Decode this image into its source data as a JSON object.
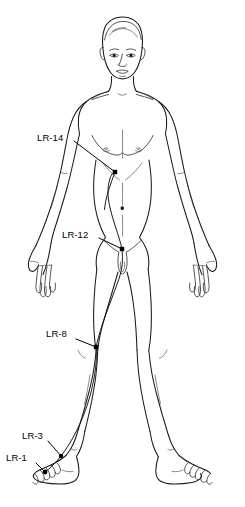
{
  "figure": {
    "view": "anterior full-body line drawing",
    "background_color": "#ffffff",
    "line_color": "#1a1a1a",
    "label_color": "#000000"
  },
  "acupoints": [
    {
      "id": "LR-14",
      "label": "LR-14",
      "region": "chest, below nipple at sixth intercostal space",
      "label_x": 37,
      "label_y": 132,
      "point_x": 115,
      "point_y": 172,
      "leader_from_x": 74,
      "leader_from_y": 141
    },
    {
      "id": "LR-12",
      "label": "LR-12",
      "region": "groin, inguinal crease lateral to pubic symphysis",
      "label_x": 62,
      "label_y": 229,
      "point_x": 122,
      "point_y": 249,
      "leader_from_x": 99,
      "leader_from_y": 238
    },
    {
      "id": "LR-8",
      "label": "LR-8",
      "region": "medial knee, end of popliteal crease",
      "label_x": 46,
      "label_y": 328,
      "point_x": 96,
      "point_y": 347,
      "leader_from_x": 76,
      "leader_from_y": 339
    },
    {
      "id": "LR-3",
      "label": "LR-3",
      "region": "dorsum of foot, between first and second metatarsal",
      "label_x": 22,
      "label_y": 430,
      "point_x": 61,
      "point_y": 456,
      "leader_from_x": 48,
      "leader_from_y": 441
    },
    {
      "id": "LR-1",
      "label": "LR-1",
      "region": "lateral corner of great toe nail",
      "label_x": 6,
      "label_y": 452,
      "point_x": 45,
      "point_y": 472,
      "leader_from_x": 36,
      "leader_from_y": 463
    }
  ],
  "meridian": {
    "name": "Liver Channel",
    "abbreviation": "LR",
    "description": "pathway ascending from great toe along medial leg to chest"
  }
}
